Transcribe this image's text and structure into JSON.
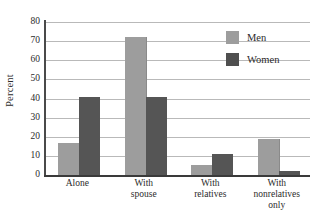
{
  "chart_data": {
    "type": "bar",
    "title": "",
    "xlabel": "",
    "ylabel": "Percent",
    "ylim": [
      0,
      80
    ],
    "yticks": [
      0,
      10,
      20,
      30,
      40,
      50,
      60,
      70,
      80
    ],
    "grid": true,
    "legend_position": "top-right",
    "categories": [
      "Alone",
      "With spouse",
      "With relatives",
      "With nonrelatives only"
    ],
    "category_lines": [
      [
        "Alone"
      ],
      [
        "With",
        "spouse"
      ],
      [
        "With",
        "relatives"
      ],
      [
        "With",
        "nonrelatives",
        "only"
      ]
    ],
    "series": [
      {
        "name": "Men",
        "color": "#9d9d9d",
        "values": [
          17,
          72,
          5,
          19
        ]
      },
      {
        "name": "Women",
        "color": "#555555",
        "values": [
          41,
          41,
          11,
          2
        ]
      }
    ]
  },
  "legend": {
    "entries": [
      {
        "label": "Men"
      },
      {
        "label": "Women"
      }
    ]
  }
}
